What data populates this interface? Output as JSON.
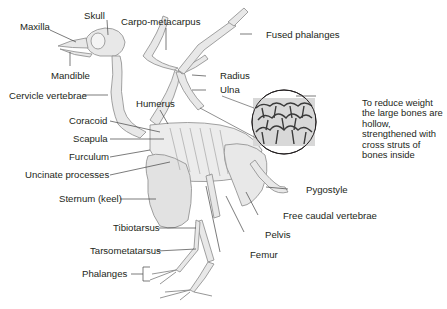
{
  "diagram": {
    "colors": {
      "bone_fill": "#e6e6e6",
      "bone_stroke": "#8a8a8a",
      "leader_line": "#444444",
      "text": "#231f20",
      "background": "#ffffff"
    },
    "labels": {
      "maxilla": "Maxilla",
      "skull": "Skull",
      "carpo_metacarpus": "Carpo-metacarpus",
      "fused_phalanges": "Fused phalanges",
      "mandible": "Mandible",
      "radius": "Radius",
      "ulna": "Ulna",
      "cervicle_vertebrae": "Cervicle vertebrae",
      "humerus": "Humerus",
      "coracoid": "Coracoid",
      "scapula": "Scapula",
      "furculum": "Furculum",
      "uncinate_processes": "Uncinate processes",
      "sternum": "Sternum (keel)",
      "pygostyle": "Pygostyle",
      "free_caudal_vertebrae": "Free caudal vertebrae",
      "pelvis": "Pelvis",
      "tibiotarsus": "Tibiotarsus",
      "femur": "Femur",
      "tarsometatarsus": "Tarsometatarsus",
      "phalanges": "Phalanges"
    },
    "inset_note": "To reduce weight the large bones are hollow, strengthened with cross struts of bones inside"
  }
}
